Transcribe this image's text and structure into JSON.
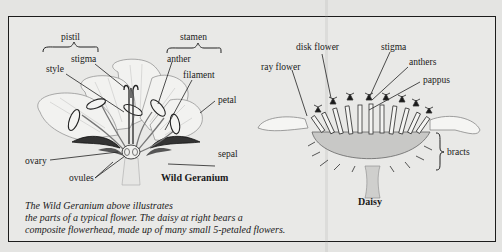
{
  "geranium": {
    "title": "Wild Geranium",
    "labels": {
      "pistil": "pistil",
      "stamen": "stamen",
      "stigma": "stigma",
      "style": "style",
      "anther": "anther",
      "filament": "filament",
      "petal": "petal",
      "ovary": "ovary",
      "ovules": "ovules",
      "sepal": "sepal"
    }
  },
  "daisy": {
    "title": "Daisy",
    "labels": {
      "ray_flower": "ray flower",
      "disk_flower": "disk flower",
      "stigma": "stigma",
      "anthers": "anthers",
      "pappus": "pappus",
      "bracts": "bracts"
    }
  },
  "caption": {
    "line1": "The Wild Geranium above illustrates",
    "line2": "the parts of a typical flower. The daisy at right  bears a",
    "line3": "composite flowerhead, made up of many small 5-petaled flowers."
  }
}
